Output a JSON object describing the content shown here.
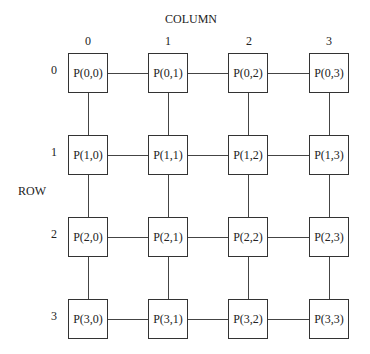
{
  "diagram": {
    "column_title": "COLUMN",
    "row_title": "ROW",
    "column_labels": [
      "0",
      "1",
      "2",
      "3"
    ],
    "row_labels": [
      "0",
      "1",
      "2",
      "3"
    ],
    "nodes": [
      [
        "P(0,0)",
        "P(0,1)",
        "P(0,2)",
        "P(0,3)"
      ],
      [
        "P(1,0)",
        "P(1,1)",
        "P(1,2)",
        "P(1,3)"
      ],
      [
        "P(2,0)",
        "P(2,1)",
        "P(2,2)",
        "P(2,3)"
      ],
      [
        "P(3,0)",
        "P(3,1)",
        "P(3,2)",
        "P(3,3)"
      ]
    ],
    "topology": "4x4 mesh, nearest-neighbor links (no wraparound)"
  }
}
